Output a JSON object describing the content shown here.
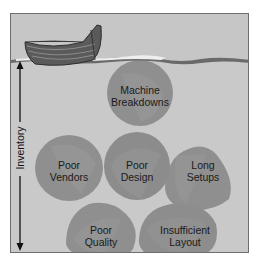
{
  "diagram": {
    "type": "lean-inventory-boat-metaphor",
    "axis": {
      "label": "Inventory",
      "direction": "vertical-double-arrow"
    },
    "rocks": [
      {
        "id": "machine-breakdowns",
        "line1": "Machine",
        "line2": "Breakdowns"
      },
      {
        "id": "poor-vendors",
        "line1": "Poor",
        "line2": "Vendors"
      },
      {
        "id": "poor-design",
        "line1": "Poor",
        "line2": "Design"
      },
      {
        "id": "long-setups",
        "line1": "Long",
        "line2": "Setups"
      },
      {
        "id": "poor-quality",
        "line1": "Poor",
        "line2": "Quality"
      },
      {
        "id": "insufficient-layout",
        "line1": "Insufficient",
        "line2": "Layout"
      }
    ],
    "colors": {
      "background": "#c9c9c9",
      "rock": "#8f8f8f",
      "rock_shadow": "#7d7d7d",
      "boat": "#5a5a5a",
      "water_dark": "#6a6a6a",
      "water_light": "#eeeeee"
    }
  }
}
